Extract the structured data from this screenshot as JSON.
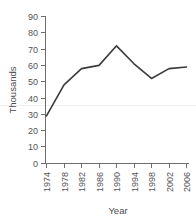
{
  "chart_data": {
    "type": "line",
    "title": "",
    "subtitle": "",
    "xlabel": "Year",
    "ylabel": "Thousands",
    "x": [
      1974,
      1978,
      1982,
      1986,
      1990,
      1994,
      1998,
      2002,
      2006
    ],
    "categories": [
      "1974",
      "1978",
      "1982",
      "1986",
      "1990",
      "1994",
      "1998",
      "2002",
      "2006"
    ],
    "values": [
      29,
      48,
      58,
      60,
      72,
      61,
      52,
      58,
      59
    ],
    "series": [
      {
        "name": "",
        "values": [
          29,
          48,
          58,
          60,
          72,
          61,
          52,
          58,
          59
        ]
      }
    ],
    "xlim": [
      1974,
      2006
    ],
    "ylim": [
      0,
      90
    ],
    "ytick_labels": [
      "0",
      "10",
      "20",
      "30",
      "40",
      "50",
      "60",
      "70",
      "80",
      "90"
    ],
    "ytick_values": [
      0,
      10,
      20,
      30,
      40,
      50,
      60,
      70,
      80,
      90
    ],
    "xtick_labels": [
      "1974",
      "1978",
      "1982",
      "1986",
      "1990",
      "1994",
      "1998",
      "2002",
      "2006"
    ],
    "grid": false,
    "legend": false,
    "legend_position": "none",
    "line_color": "#3b3b3b",
    "axis_color": "#6e6e6e",
    "annotations": []
  }
}
